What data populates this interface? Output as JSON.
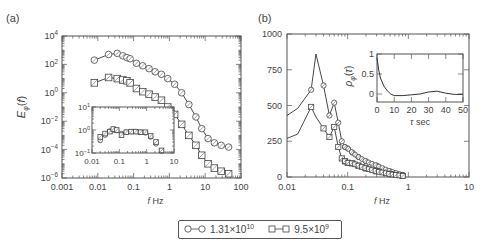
{
  "panels": {
    "a": {
      "label": "(a)",
      "ylabel": "E_φ(f)",
      "xlabel": "f Hz",
      "xticks": [
        "0.001",
        "0.01",
        "0.1",
        "1",
        "10",
        "100"
      ],
      "yticks": [
        "10^4",
        "10^2",
        "10^0",
        "10^-2",
        "10^-4",
        "10^-6"
      ],
      "inset": {
        "xticks": [
          "0.01",
          "0.1",
          "1",
          "10"
        ],
        "yticks": [
          "10^1",
          "10^0",
          "10^-1"
        ]
      }
    },
    "b": {
      "label": "(b)",
      "xlabel": "f Hz",
      "xticks": [
        "0.01",
        "0.1",
        "1",
        "10"
      ],
      "yticks": [
        "1000",
        "750",
        "500",
        "250",
        "0"
      ],
      "inset": {
        "ylabel": "ρ_φ(τ)",
        "xlabel": "τ sec",
        "xticks": [
          "0",
          "10",
          "20",
          "30",
          "40",
          "50"
        ],
        "yticks": [
          "1",
          "0.5",
          "0"
        ]
      }
    }
  },
  "legend": {
    "items": [
      {
        "marker": "circle",
        "mantissa": "1.31×10",
        "exp": "10"
      },
      {
        "marker": "square",
        "mantissa": "9.5×10",
        "exp": "9"
      }
    ]
  },
  "chart_data": [
    {
      "type": "line",
      "title": "(a)",
      "xlabel": "f Hz",
      "ylabel": "E_phi(f)",
      "xscale": "log",
      "yscale": "log",
      "xlim": [
        0.001,
        100
      ],
      "ylim": [
        1e-06,
        10000.0
      ],
      "x": [
        0.008,
        0.02,
        0.035,
        0.05,
        0.065,
        0.08,
        0.12,
        0.18,
        0.27,
        0.4,
        0.6,
        0.9,
        1.4,
        2.2,
        3.5,
        5.5,
        8,
        12,
        18,
        28,
        45
      ],
      "series": [
        {
          "name": "1.31×10^10",
          "marker": "circle",
          "values": [
            200,
            500,
            600,
            400,
            300,
            250,
            120,
            80,
            50,
            30,
            20,
            10,
            4,
            1,
            0.15,
            0.02,
            0.003,
            0.0006,
            0.0003,
            0.0002,
            0.00015
          ]
        },
        {
          "name": "9.5×10^9",
          "marker": "square",
          "values": [
            5,
            12,
            10,
            8,
            7,
            5,
            2,
            1.2,
            0.8,
            0.5,
            0.3,
            0.1,
            0.03,
            0.006,
            0.001,
            0.0002,
            4e-05,
            1e-05,
            5e-06,
            3e-06,
            2e-06
          ]
        }
      ],
      "inset": {
        "type": "scatter",
        "xscale": "log",
        "yscale": "log",
        "xlim": [
          0.01,
          10
        ],
        "ylim": [
          0.1,
          10
        ],
        "x": [
          0.02,
          0.03,
          0.045,
          0.06,
          0.08,
          0.12,
          0.18,
          0.27,
          0.4,
          0.6,
          0.9,
          1.4,
          2.2,
          3.5
        ],
        "series": [
          {
            "name": "1.31×10^10",
            "values": [
              0.35,
              0.6,
              0.9,
              1.0,
              0.95,
              0.7,
              0.8,
              0.85,
              0.85,
              0.8,
              0.75,
              0.5,
              0.25,
              0.12
            ]
          },
          {
            "name": "9.5×10^9",
            "values": [
              0.5,
              0.7,
              0.85,
              1.1,
              1.0,
              0.6,
              0.8,
              0.85,
              0.85,
              0.8,
              0.8,
              0.55,
              0.3,
              0.13
            ]
          }
        ]
      }
    },
    {
      "type": "line",
      "title": "(b)",
      "xlabel": "f Hz",
      "ylabel": "",
      "xscale": "log",
      "xlim": [
        0.01,
        10
      ],
      "ylim": [
        0,
        1000
      ],
      "x": [
        0.01,
        0.015,
        0.025,
        0.03,
        0.04,
        0.05,
        0.06,
        0.07,
        0.08,
        0.09,
        0.1,
        0.12,
        0.15,
        0.2,
        0.3,
        0.5,
        0.8
      ],
      "series": [
        {
          "name": "1.31×10^10",
          "marker": "circle",
          "values": [
            430,
            480,
            610,
            860,
            640,
            430,
            520,
            380,
            250,
            210,
            200,
            170,
            140,
            110,
            80,
            40,
            15
          ]
        },
        {
          "name": "9.5×10^9",
          "marker": "square",
          "values": [
            270,
            300,
            490,
            420,
            340,
            280,
            350,
            210,
            130,
            110,
            100,
            95,
            80,
            60,
            40,
            20,
            8
          ]
        }
      ],
      "inset": {
        "type": "line",
        "xlabel": "τ sec",
        "ylabel": "ρ_φ(τ)",
        "xlim": [
          0,
          50
        ],
        "ylim": [
          -0.2,
          1
        ],
        "x": [
          0,
          1,
          2,
          4,
          6,
          8,
          10,
          15,
          20,
          25,
          30,
          35,
          40,
          45,
          50
        ],
        "values": [
          0.9,
          0.6,
          0.4,
          0.2,
          0.08,
          0.0,
          -0.04,
          -0.04,
          -0.02,
          0.0,
          0.05,
          0.07,
          0.02,
          -0.01,
          -0.01
        ]
      }
    }
  ]
}
